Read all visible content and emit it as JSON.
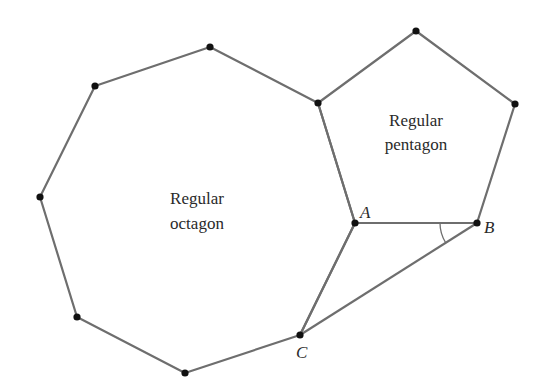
{
  "diagram": {
    "type": "geometry",
    "colors": {
      "edge": "#6e6e6e",
      "vertex": "#111111",
      "text": "#2a2a2a",
      "background": "#ffffff"
    },
    "octagon": {
      "label_line1": "Regular",
      "label_line2": "octagon",
      "vertices": [
        [
          95,
          86
        ],
        [
          210,
          47
        ],
        [
          318,
          103
        ],
        [
          355,
          223
        ],
        [
          300,
          335
        ],
        [
          185,
          373
        ],
        [
          77,
          317
        ],
        [
          40,
          197
        ]
      ]
    },
    "pentagon": {
      "label_line1": "Regular",
      "label_line2": "pentagon",
      "vertices": [
        [
          318,
          103
        ],
        [
          416,
          31
        ],
        [
          515,
          104
        ],
        [
          477,
          223
        ],
        [
          355,
          223
        ]
      ]
    },
    "points": {
      "A": {
        "label": "A",
        "x": 355,
        "y": 223
      },
      "B": {
        "label": "B",
        "x": 477,
        "y": 223
      },
      "C": {
        "label": "C",
        "x": 300,
        "y": 335
      }
    },
    "segments": [
      [
        "A",
        "B"
      ],
      [
        "B",
        "C"
      ],
      [
        "A",
        "C"
      ]
    ],
    "angle_mark": {
      "at": "B",
      "between": [
        "A",
        "C"
      ],
      "radius": 37
    }
  }
}
